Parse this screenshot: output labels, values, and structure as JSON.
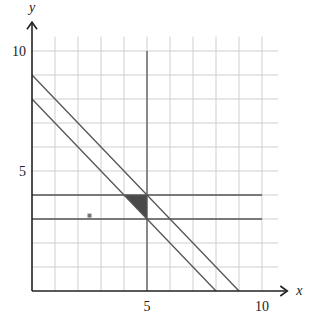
{
  "chart_data": {
    "type": "line",
    "title": "",
    "xlabel": "x",
    "ylabel": "y",
    "xlim": [
      0,
      10
    ],
    "ylim": [
      0,
      10
    ],
    "grid": true,
    "x_ticks": [
      {
        "value": 5,
        "label": "5"
      },
      {
        "value": 10,
        "label": "10"
      }
    ],
    "y_ticks": [
      {
        "value": 5,
        "label": "5"
      },
      {
        "value": 10,
        "label": "10"
      }
    ],
    "lines": [
      {
        "name": "y = 9 - x",
        "points": [
          [
            0,
            9
          ],
          [
            9,
            0
          ]
        ]
      },
      {
        "name": "y = 8 - x",
        "points": [
          [
            0,
            8
          ],
          [
            8,
            0
          ]
        ]
      },
      {
        "name": "y = 4",
        "points": [
          [
            0,
            4
          ],
          [
            10,
            4
          ]
        ]
      },
      {
        "name": "y = 3",
        "points": [
          [
            0,
            3
          ],
          [
            10,
            3
          ]
        ]
      },
      {
        "name": "x = 5",
        "points": [
          [
            5,
            0
          ],
          [
            5,
            10
          ]
        ]
      }
    ],
    "shaded_region": {
      "vertices": [
        [
          4,
          4
        ],
        [
          5,
          4
        ],
        [
          5,
          3
        ]
      ],
      "color": "#4a4a4a"
    },
    "points": [
      [
        2.5,
        3.1
      ]
    ]
  },
  "colors": {
    "grid": "#cfcfcf",
    "line": "#555555",
    "axis": "#222222",
    "shade": "#4a4a4a"
  }
}
